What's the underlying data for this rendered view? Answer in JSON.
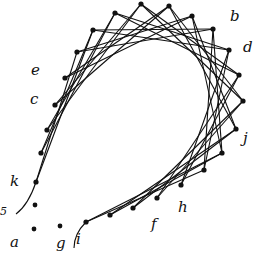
{
  "diagram": {
    "type": "curve-stitching string art",
    "stroke_color": "#111111",
    "background": "#ffffff",
    "ring_points": [
      [
        36,
        182
      ],
      [
        41,
        153
      ],
      [
        47,
        130
      ],
      [
        55,
        105
      ],
      [
        65,
        78
      ],
      [
        77,
        52
      ],
      [
        93,
        30
      ],
      [
        115,
        13
      ],
      [
        141,
        4
      ],
      [
        169,
        6
      ],
      [
        192,
        16
      ],
      [
        213,
        29
      ],
      [
        229,
        50
      ],
      [
        239,
        75
      ],
      [
        243,
        101
      ],
      [
        236,
        129
      ],
      [
        222,
        153
      ],
      [
        204,
        170
      ],
      [
        181,
        185
      ],
      [
        157,
        198
      ],
      [
        133,
        208
      ],
      [
        110,
        215
      ],
      [
        86,
        222
      ]
    ],
    "chord_skip": 5,
    "loose_points": [
      [
        35,
        205
      ],
      [
        34,
        229
      ],
      [
        60,
        226
      ]
    ],
    "tail_curves": [
      {
        "name": "left-tail",
        "d": "M16,214 C24,208 30,200 36,182"
      },
      {
        "name": "bottom-tail",
        "d": "M74,248 C74,240 78,230 86,222"
      }
    ],
    "labels": [
      {
        "text": "b",
        "x": 230,
        "y": 21
      },
      {
        "text": "d",
        "x": 243,
        "y": 52
      },
      {
        "text": "e",
        "x": 31,
        "y": 75
      },
      {
        "text": "c",
        "x": 30,
        "y": 104
      },
      {
        "text": "j",
        "x": 243,
        "y": 143
      },
      {
        "text": "k",
        "x": 10,
        "y": 186
      },
      {
        "text": "h",
        "x": 178,
        "y": 212
      },
      {
        "text": "f",
        "x": 151,
        "y": 229
      },
      {
        "text": "a",
        "x": 10,
        "y": 247
      },
      {
        "text": "g",
        "x": 56,
        "y": 248
      },
      {
        "text": "i",
        "x": 76,
        "y": 244
      },
      {
        "text": "5",
        "x": 0,
        "y": 215,
        "small": true
      }
    ]
  }
}
